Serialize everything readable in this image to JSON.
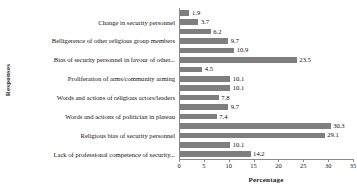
{
  "chart_data": {
    "type": "bar",
    "orientation": "horizontal",
    "title": "",
    "xlabel": "Percentage",
    "ylabel": "Responses",
    "xlim": [
      0,
      35
    ],
    "xticks": [
      0,
      5,
      10,
      15,
      20,
      25,
      30,
      35
    ],
    "grid": false,
    "legend": null,
    "bar_color": "#7f7f7f",
    "axis_color": "#8a8a8a",
    "categories": [
      "",
      "Change in security personnel",
      "",
      "Belligerence of other religious group members",
      "",
      "Bias of security personnel in favour of other...",
      "",
      "Proliferation of arms/community arming",
      "",
      "Words and actions of religious actors/leaders",
      "",
      "Words and actions of politician in plateau",
      "",
      "Religious bias of security personnel",
      "",
      "Lack of professional competence of security..."
    ],
    "visible_category_labels": [
      "Change in security personnel",
      "Belligerence of other religious group members",
      "Bias of security personnel in favour of other...",
      "Proliferation of arms/community arming",
      "Words and actions of religious actors/leaders",
      "Words and actions of politician in plateau",
      "Religious bias of security personnel",
      "Lack of professional competence of security..."
    ],
    "values": [
      1.9,
      3.7,
      6.2,
      9.7,
      10.9,
      23.5,
      4.5,
      10.1,
      10.1,
      7.8,
      9.7,
      7.4,
      30.3,
      29.1,
      10.1,
      14.2
    ],
    "data_labels": [
      "1.9",
      "3.7",
      "6.2",
      "9.7",
      "10.9",
      "23.5",
      "4.5",
      "10.1",
      "10.1",
      "7.8",
      "9.7",
      "7.4",
      "30.3",
      "29.1",
      "10.1",
      "14.2"
    ],
    "xtick_labels": [
      "0",
      "5",
      "10",
      "15",
      "20",
      "25",
      "30",
      "35"
    ]
  }
}
